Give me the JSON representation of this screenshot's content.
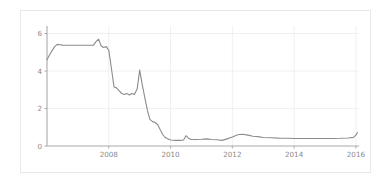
{
  "figure": {
    "background_color": "#ffffff",
    "frame_color": "#e8e8e8",
    "line_color": "#8c8c8c",
    "grid_color": "#f0f0f0",
    "axis_color": "#aaaaaa",
    "tick_label_color": "#8a8a8a"
  },
  "chart_data": {
    "type": "line",
    "title": "",
    "subtitle": "",
    "xlabel": "",
    "ylabel": "",
    "xlim": [
      2006.0,
      2016.1
    ],
    "ylim": [
      0,
      6.4
    ],
    "grid": true,
    "legend": false,
    "legend_position": "none",
    "xticks": [
      2008,
      2010,
      2012,
      2014,
      2016
    ],
    "xtick_labels": [
      "2008",
      "2010",
      "2012",
      "2014",
      "2016"
    ],
    "yticks": [
      0,
      2,
      4,
      6
    ],
    "ytick_labels": [
      "0",
      "2",
      "4",
      "6"
    ],
    "series": [
      {
        "name": "rate",
        "color": "#8c8c8c",
        "x": [
          2006.0,
          2006.08,
          2006.17,
          2006.25,
          2006.33,
          2006.42,
          2006.5,
          2006.58,
          2006.67,
          2006.75,
          2006.83,
          2006.92,
          2007.0,
          2007.08,
          2007.17,
          2007.25,
          2007.33,
          2007.42,
          2007.5,
          2007.58,
          2007.67,
          2007.75,
          2007.83,
          2007.92,
          2008.0,
          2008.08,
          2008.17,
          2008.25,
          2008.33,
          2008.42,
          2008.5,
          2008.58,
          2008.67,
          2008.75,
          2008.83,
          2008.92,
          2009.0,
          2009.08,
          2009.17,
          2009.25,
          2009.33,
          2009.42,
          2009.5,
          2009.58,
          2009.67,
          2009.75,
          2009.83,
          2009.92,
          2010.0,
          2010.17,
          2010.33,
          2010.42,
          2010.5,
          2010.58,
          2010.67,
          2010.83,
          2011.0,
          2011.17,
          2011.33,
          2011.5,
          2011.67,
          2011.83,
          2012.0,
          2012.17,
          2012.33,
          2012.5,
          2012.67,
          2012.83,
          2013.0,
          2013.25,
          2013.5,
          2013.75,
          2014.0,
          2014.25,
          2014.5,
          2014.75,
          2015.0,
          2015.25,
          2015.5,
          2015.75,
          2015.92,
          2016.0,
          2016.05
        ],
        "y": [
          4.6,
          4.85,
          5.1,
          5.3,
          5.42,
          5.4,
          5.38,
          5.37,
          5.37,
          5.37,
          5.37,
          5.37,
          5.37,
          5.37,
          5.37,
          5.37,
          5.37,
          5.37,
          5.37,
          5.55,
          5.7,
          5.35,
          5.25,
          5.3,
          5.1,
          4.2,
          3.15,
          3.1,
          2.95,
          2.8,
          2.75,
          2.8,
          2.72,
          2.8,
          2.75,
          3.05,
          4.05,
          3.3,
          2.55,
          1.9,
          1.42,
          1.3,
          1.25,
          1.15,
          0.85,
          0.6,
          0.45,
          0.38,
          0.32,
          0.3,
          0.3,
          0.32,
          0.55,
          0.42,
          0.35,
          0.35,
          0.36,
          0.38,
          0.35,
          0.33,
          0.3,
          0.38,
          0.48,
          0.6,
          0.63,
          0.58,
          0.52,
          0.5,
          0.45,
          0.44,
          0.42,
          0.41,
          0.4,
          0.4,
          0.4,
          0.4,
          0.4,
          0.4,
          0.41,
          0.43,
          0.46,
          0.58,
          0.72
        ]
      }
    ]
  }
}
